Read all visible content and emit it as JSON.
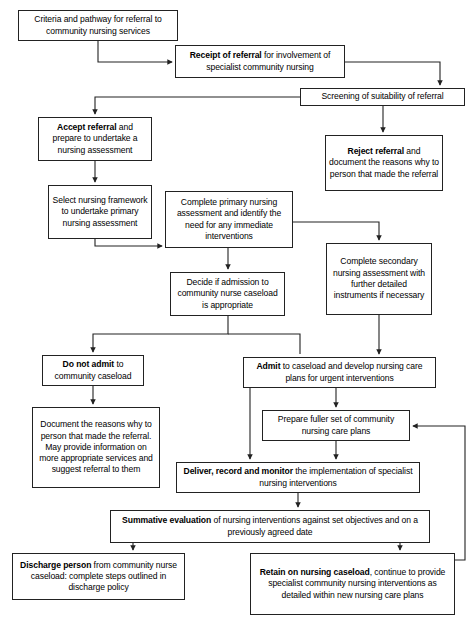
{
  "diagram": {
    "line_color": "#222222",
    "box_border_color": "#222222",
    "background": "#ffffff"
  },
  "nodes": {
    "criteria": {
      "text": "Criteria and pathway for referral to community nursing services"
    },
    "receipt": {
      "bold": "Receipt of referral",
      "rest": " for involvement of specialist community nursing"
    },
    "screening": {
      "text": "Screening of suitability of referral"
    },
    "accept": {
      "bold": "Accept referral",
      "rest": " and prepare to undertake a nursing assessment"
    },
    "reject": {
      "bold": "Reject referral",
      "rest": " and document the reasons why to person that made the referral"
    },
    "select": {
      "text": "Select nursing framework to undertake primary nursing assessment"
    },
    "primary": {
      "text": "Complete primary nursing assessment and identify the need for any immediate interventions"
    },
    "secondary": {
      "text": "Complete secondary nursing assessment with further detailed instruments if necessary"
    },
    "decide": {
      "text": "Decide if admission to community nurse caseload is appropriate"
    },
    "noadmit": {
      "bold": "Do not admit",
      "rest": " to community caseload"
    },
    "admit": {
      "bold": "Admit",
      "rest": " to caseload and develop nursing care plans for urgent interventions"
    },
    "document": {
      "text": "Document the reasons why to person that made the referral. May provide information on more appropriate services and suggest referral to them"
    },
    "prepare": {
      "text": "Prepare fuller set of community nursing care plans"
    },
    "deliver": {
      "bold": "Deliver, record and monitor",
      "rest": " the implementation of specialist nursing interventions"
    },
    "summative": {
      "bold": "Summative evaluation",
      "rest": " of nursing interventions against set objectives and on a previously agreed date"
    },
    "discharge": {
      "bold": "Discharge person",
      "rest": " from community nurse caseload: complete steps outlined in discharge policy"
    },
    "retain": {
      "bold": "Retain on nursing caseload",
      "rest": ", continue to provide specialist community nursing interventions as detailed within new nursing care plans"
    }
  },
  "edges": [
    {
      "from": "criteria",
      "to": "receipt",
      "name": "criteria-to-receipt"
    },
    {
      "from": "receipt",
      "to": "screening",
      "name": "receipt-to-screening"
    },
    {
      "from": "screening",
      "to": "accept",
      "name": "screening-to-accept"
    },
    {
      "from": "screening",
      "to": "reject",
      "name": "screening-to-reject"
    },
    {
      "from": "accept",
      "to": "select",
      "name": "accept-to-select"
    },
    {
      "from": "select",
      "to": "primary",
      "name": "select-to-primary"
    },
    {
      "from": "primary",
      "to": "decide",
      "name": "primary-to-decide"
    },
    {
      "from": "primary",
      "to": "secondary",
      "name": "primary-to-secondary"
    },
    {
      "from": "decide",
      "to": "noadmit",
      "name": "decide-to-do-not-admit"
    },
    {
      "from": "secondary",
      "to": "admit",
      "name": "secondary-to-admit"
    },
    {
      "from": "decide",
      "to": "admit",
      "name": "decide-to-admit"
    },
    {
      "from": "noadmit",
      "to": "document",
      "name": "do-not-admit-to-document"
    },
    {
      "from": "admit",
      "to": "prepare",
      "name": "admit-to-prepare"
    },
    {
      "from": "admit",
      "to": "deliver",
      "name": "admit-to-deliver"
    },
    {
      "from": "prepare",
      "to": "deliver",
      "name": "prepare-to-deliver"
    },
    {
      "from": "deliver",
      "to": "summative",
      "name": "deliver-to-summative"
    },
    {
      "from": "summative",
      "to": "discharge",
      "name": "summative-to-discharge"
    },
    {
      "from": "summative",
      "to": "retain",
      "name": "summative-to-retain"
    },
    {
      "from": "retain",
      "to": "prepare",
      "name": "retain-to-prepare-feedback"
    }
  ]
}
